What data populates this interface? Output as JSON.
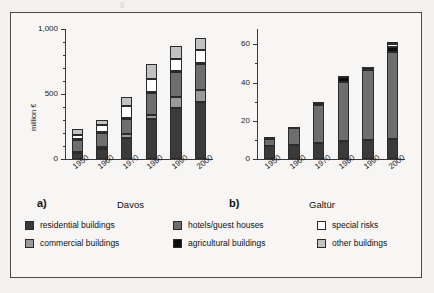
{
  "ghost_text": "g",
  "legend": {
    "items": [
      {
        "label": "residential buildings",
        "color": "#3a3a3a",
        "col": 0,
        "row": 0
      },
      {
        "label": "commercial buildings",
        "color": "#9a9a9a",
        "col": 0,
        "row": 1
      },
      {
        "label": "hotels/guest houses",
        "color": "#6e6e6e",
        "col": 1,
        "row": 0
      },
      {
        "label": "agricultural buildings",
        "color": "#0d0d0d",
        "col": 1,
        "row": 1
      },
      {
        "label": "special risks",
        "color": "#ffffff",
        "col": 2,
        "row": 0
      },
      {
        "label": "other buildings",
        "color": "#c2c2c2",
        "col": 2,
        "row": 1
      }
    ]
  },
  "chart_data": [
    {
      "type": "bar",
      "stacked": true,
      "panel_letter": "a)",
      "title": "Davos",
      "xlabel": "",
      "ylabel": "million €",
      "categories": [
        "1950",
        "1960",
        "1970",
        "1980",
        "1990",
        "2000"
      ],
      "ylim": [
        0,
        1000
      ],
      "yticks": [
        0,
        500,
        1000
      ],
      "ytick_labels": [
        "0",
        "500",
        "1,000"
      ],
      "yminor_step": 100,
      "grid": false,
      "legend_position": "below",
      "series": [
        {
          "name": "residential buildings",
          "color": "#3a3a3a",
          "values": [
            45,
            80,
            165,
            305,
            390,
            440
          ]
        },
        {
          "name": "commercial buildings",
          "color": "#9a9a9a",
          "values": [
            10,
            15,
            25,
            35,
            85,
            90
          ]
        },
        {
          "name": "hotels/guest houses",
          "color": "#6e6e6e",
          "values": [
            90,
            105,
            120,
            170,
            195,
            200
          ]
        },
        {
          "name": "agricultural buildings",
          "color": "#0d0d0d",
          "values": [
            8,
            8,
            8,
            8,
            8,
            8
          ]
        },
        {
          "name": "special risks",
          "color": "#ffffff",
          "values": [
            35,
            55,
            90,
            100,
            95,
            100
          ]
        },
        {
          "name": "other buildings",
          "color": "#c2c2c2",
          "values": [
            45,
            40,
            70,
            110,
            100,
            95
          ]
        }
      ],
      "totals": [
        233,
        303,
        478,
        728,
        873,
        933
      ]
    },
    {
      "type": "bar",
      "stacked": true,
      "panel_letter": "b)",
      "title": "Galtür",
      "xlabel": "",
      "ylabel": "",
      "categories": [
        "1950",
        "1960",
        "1970",
        "1980",
        "1990",
        "2000"
      ],
      "ylim": [
        0,
        68
      ],
      "yticks": [
        0,
        20,
        40,
        60
      ],
      "ytick_labels": [
        "0",
        "20",
        "40",
        "60"
      ],
      "yminor_step": 10,
      "grid": false,
      "legend_position": "below",
      "series": [
        {
          "name": "residential buildings",
          "color": "#3a3a3a",
          "values": [
            7.0,
            7.5,
            8.5,
            9.5,
            10.0,
            10.5
          ]
        },
        {
          "name": "commercial buildings",
          "color": "#9a9a9a",
          "values": [
            0.0,
            0.0,
            0.0,
            0.0,
            0.0,
            0.0
          ]
        },
        {
          "name": "hotels/guest houses",
          "color": "#6e6e6e",
          "values": [
            3.5,
            8.5,
            20.0,
            31.0,
            36.5,
            45.5
          ]
        },
        {
          "name": "agricultural buildings",
          "color": "#0d0d0d",
          "values": [
            0.6,
            0.6,
            0.8,
            2.5,
            1.2,
            2.6
          ]
        },
        {
          "name": "special risks",
          "color": "#ffffff",
          "values": [
            0.0,
            0.0,
            0.0,
            0.0,
            0.0,
            1.5
          ]
        },
        {
          "name": "other buildings",
          "color": "#c2c2c2",
          "values": [
            0.4,
            0.4,
            0.4,
            0.5,
            0.6,
            1.0
          ]
        }
      ],
      "totals": [
        11.5,
        17.0,
        29.7,
        43.5,
        48.3,
        61.1
      ]
    }
  ]
}
